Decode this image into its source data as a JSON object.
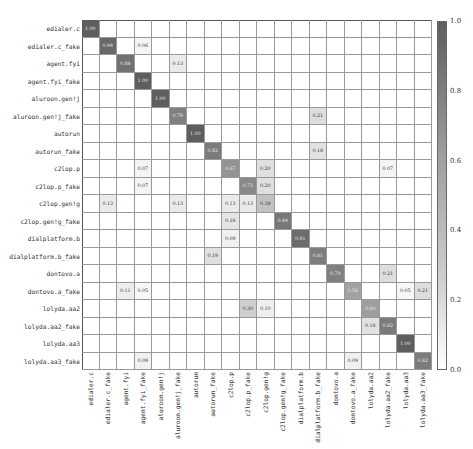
{
  "chart_data": {
    "type": "heatmap",
    "title": "",
    "xlabel": "",
    "ylabel": "",
    "labels": [
      "edialer.c",
      "edialer.c_fake",
      "agent.fyi",
      "agent.fyi_fake",
      "aluroon.gen!j",
      "aluroon.gen!j_fake",
      "autorun",
      "autorun_fake",
      "c2lop.p",
      "c2lop.p_fake",
      "c2lop.gen!g",
      "c2lop.gen!g_fake",
      "dialplatform.b",
      "dialplatform.b_fake",
      "dontovo.a",
      "dontovo.a_fake",
      "lolyda.aa2",
      "lolyda.aa2_fake",
      "lolyda.aa3",
      "lolyda.aa3_fake"
    ],
    "colorbar": {
      "min": 0.0,
      "max": 1.0,
      "ticks": [
        "0.0",
        "0.2",
        "0.4",
        "0.6",
        "0.8",
        "1.0"
      ]
    },
    "cells": [
      {
        "r": 0,
        "c": 0,
        "v": "1.00"
      },
      {
        "r": 1,
        "c": 1,
        "v": "0.94"
      },
      {
        "r": 1,
        "c": 3,
        "v": "0.06"
      },
      {
        "r": 2,
        "c": 2,
        "v": "0.88"
      },
      {
        "r": 2,
        "c": 5,
        "v": "0.13"
      },
      {
        "r": 3,
        "c": 3,
        "v": "1.00"
      },
      {
        "r": 4,
        "c": 4,
        "v": "1.00"
      },
      {
        "r": 5,
        "c": 5,
        "v": "0.79"
      },
      {
        "r": 5,
        "c": 13,
        "v": "0.21"
      },
      {
        "r": 6,
        "c": 6,
        "v": "1.00"
      },
      {
        "r": 7,
        "c": 7,
        "v": "0.82"
      },
      {
        "r": 7,
        "c": 13,
        "v": "0.18"
      },
      {
        "r": 8,
        "c": 3,
        "v": "0.07"
      },
      {
        "r": 8,
        "c": 8,
        "v": "0.67"
      },
      {
        "r": 8,
        "c": 10,
        "v": "0.20"
      },
      {
        "r": 8,
        "c": 17,
        "v": "0.07"
      },
      {
        "r": 9,
        "c": 3,
        "v": "0.07"
      },
      {
        "r": 9,
        "c": 9,
        "v": "0.73"
      },
      {
        "r": 9,
        "c": 10,
        "v": "0.20"
      },
      {
        "r": 10,
        "c": 1,
        "v": "0.13"
      },
      {
        "r": 10,
        "c": 5,
        "v": "0.13"
      },
      {
        "r": 10,
        "c": 8,
        "v": "0.13"
      },
      {
        "r": 10,
        "c": 9,
        "v": "0.13"
      },
      {
        "r": 10,
        "c": 10,
        "v": "0.38"
      },
      {
        "r": 11,
        "c": 8,
        "v": "0.16"
      },
      {
        "r": 11,
        "c": 11,
        "v": "0.84"
      },
      {
        "r": 12,
        "c": 8,
        "v": "0.09"
      },
      {
        "r": 12,
        "c": 12,
        "v": "0.91"
      },
      {
        "r": 13,
        "c": 7,
        "v": "0.19"
      },
      {
        "r": 13,
        "c": 13,
        "v": "0.81"
      },
      {
        "r": 14,
        "c": 14,
        "v": "0.79"
      },
      {
        "r": 14,
        "c": 17,
        "v": "0.21"
      },
      {
        "r": 15,
        "c": 2,
        "v": "0.11"
      },
      {
        "r": 15,
        "c": 3,
        "v": "0.05"
      },
      {
        "r": 15,
        "c": 15,
        "v": "0.58"
      },
      {
        "r": 15,
        "c": 18,
        "v": "0.05"
      },
      {
        "r": 15,
        "c": 19,
        "v": "0.21"
      },
      {
        "r": 16,
        "c": 9,
        "v": "0.30"
      },
      {
        "r": 16,
        "c": 10,
        "v": "0.10"
      },
      {
        "r": 16,
        "c": 16,
        "v": "0.60"
      },
      {
        "r": 17,
        "c": 16,
        "v": "0.18"
      },
      {
        "r": 17,
        "c": 17,
        "v": "0.82"
      },
      {
        "r": 18,
        "c": 18,
        "v": "1.00"
      },
      {
        "r": 19,
        "c": 3,
        "v": "0.09"
      },
      {
        "r": 19,
        "c": 15,
        "v": "0.09"
      },
      {
        "r": 19,
        "c": 19,
        "v": "0.82"
      }
    ],
    "grid": true,
    "legend_position": "right colorbar"
  }
}
